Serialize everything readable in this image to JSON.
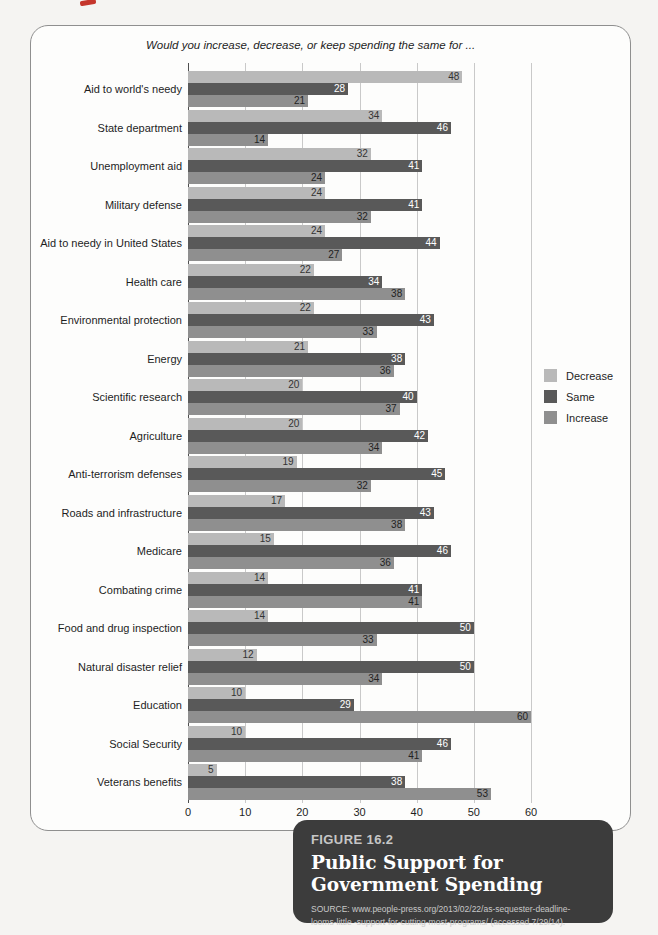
{
  "figure": {
    "question_title": "Would you increase, decrease, or keep spending the same for ...",
    "caption": {
      "figure_label": "FIGURE 16.2",
      "title": "Public Support for Government Spending",
      "source": "SOURCE: www.people-press.org/2013/02/22/as-sequester-deadline-looms-little -support-for-cutting-most-programs/ (accessed 7/29/14)."
    }
  },
  "colors": {
    "page_bg": "#f5f4f2",
    "panel_border": "#8f8f8f",
    "caption_bg": "#3c3c3c",
    "decrease_bar": "#b9b9b9",
    "same_bar": "#595959",
    "increase_bar": "#8f8f8f",
    "annotation_mark": "#c5362c"
  },
  "chart_data": {
    "type": "bar",
    "orientation": "horizontal",
    "title": "Would you increase, decrease, or keep spending the same for ...",
    "xlabel": "",
    "ylabel": "",
    "xlim": [
      0,
      60
    ],
    "xticks": [
      0,
      10,
      20,
      30,
      40,
      50,
      60
    ],
    "grid": "vertical",
    "legend_position": "right",
    "categories": [
      "Aid to world's needy",
      "State department",
      "Unemployment aid",
      "Military defense",
      "Aid to needy in United States",
      "Health care",
      "Environmental protection",
      "Energy",
      "Scientific research",
      "Agriculture",
      "Anti-terrorism defenses",
      "Roads and infrastructure",
      "Medicare",
      "Combating crime",
      "Food and drug inspection",
      "Natural disaster relief",
      "Education",
      "Social Security",
      "Veterans benefits"
    ],
    "series": [
      {
        "name": "Decrease",
        "color": "#b9b9b9",
        "label_color": "#333333",
        "values": [
          48,
          34,
          32,
          24,
          24,
          22,
          22,
          21,
          20,
          20,
          19,
          17,
          15,
          14,
          14,
          12,
          10,
          10,
          5
        ]
      },
      {
        "name": "Same",
        "color": "#595959",
        "label_color": "#ffffff",
        "values": [
          28,
          46,
          41,
          41,
          44,
          34,
          43,
          38,
          40,
          42,
          45,
          43,
          46,
          41,
          50,
          50,
          29,
          46,
          38
        ]
      },
      {
        "name": "Increase",
        "color": "#8f8f8f",
        "label_color": "#222222",
        "values": [
          21,
          14,
          24,
          32,
          27,
          38,
          33,
          36,
          37,
          34,
          32,
          38,
          36,
          41,
          33,
          34,
          60,
          41,
          53
        ]
      }
    ]
  }
}
